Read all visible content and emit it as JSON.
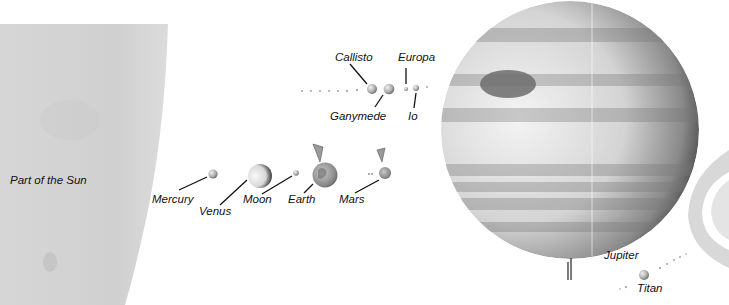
{
  "diagram": {
    "type": "solar-system-size-comparison",
    "labels": {
      "sun": "Part of the Sun",
      "mercury": "Mercury",
      "venus": "Venus",
      "moon": "Moon",
      "earth": "Earth",
      "mars": "Mars",
      "callisto": "Callisto",
      "ganymede": "Ganymede",
      "europa": "Europa",
      "io": "Io",
      "jupiter": "Jupiter",
      "titan": "Titan"
    },
    "colors": {
      "background": "#ffffff",
      "sun": "#d2d2d2",
      "jupiter_light": "#e6e6e6",
      "jupiter_dark": "#4a4a4a",
      "saturn_rings": "#d8d8d8",
      "label_text": "#111111"
    }
  }
}
